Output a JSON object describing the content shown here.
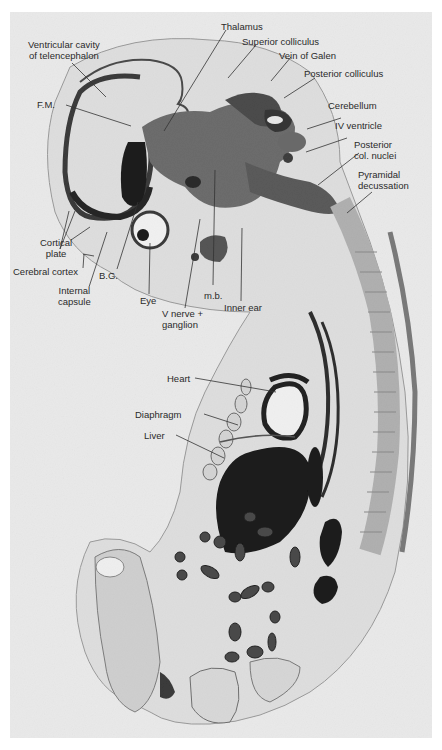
{
  "figure": {
    "header_cropped": "",
    "image_description": "Sagittal histological section of an embryo with labeled anatomical structures",
    "colors": {
      "background": "#ffffff",
      "plate": "#e9e9e9",
      "tissue_dark": "#2b2b2b",
      "tissue_mid": "#7a7a7a",
      "tissue_light": "#cfcfcf",
      "label_text": "#2a2a2a",
      "leader_line": "#333333"
    }
  },
  "labels": {
    "ventricular_cavity_line1": "Ventricular cavity",
    "ventricular_cavity_line2": "of telencephalon",
    "fm": "F.M.",
    "thalamus": "Thalamus",
    "superior_colliculus": "Superior colliculus",
    "vein_of_galen": "Vein of Galen",
    "posterior_colliculus": "Posterior colliculus",
    "cerebellum": "Cerebellum",
    "iv_ventricle": "IV ventricle",
    "posterior_col_nuclei_line1": "Posterior",
    "posterior_col_nuclei_line2": "col. nuclei",
    "pyramidal_decussation_line1": "Pyramidal",
    "pyramidal_decussation_line2": "decussation",
    "cortical_plate_line1": "Cortical",
    "cortical_plate_line2": "plate",
    "cerebral_cortex": "Cerebral cortex",
    "internal_capsule_line1": "Internal",
    "internal_capsule_line2": "capsule",
    "bg": "B.G.",
    "eye": "Eye",
    "mb": "m.b.",
    "v_nerve_line1": "V nerve +",
    "v_nerve_line2": "ganglion",
    "inner_ear": "Inner ear",
    "heart": "Heart",
    "diaphragm": "Diaphragm",
    "liver": "Liver"
  }
}
